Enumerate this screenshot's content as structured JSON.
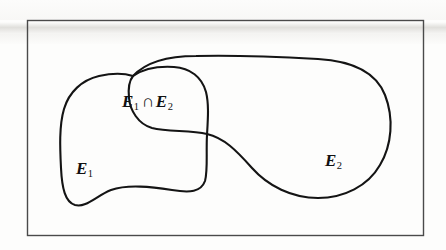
{
  "figure": {
    "kind": "venn-diagram",
    "frame": {
      "name": "universal-set-rectangle",
      "x": 27,
      "y": 20,
      "width": 397,
      "height": 216,
      "border_color": "#4a4a4a"
    },
    "stroke_color": "#141414",
    "background_color": "#fdfdfc"
  },
  "labels": {
    "intersection": {
      "set_a": "E",
      "set_a_sub": "1",
      "operator": "∩",
      "set_b": "E",
      "set_b_sub": "2",
      "text": "E1 ∩ E2"
    },
    "e1": {
      "symbol": "E",
      "subscript": "1",
      "text": "E1"
    },
    "e2": {
      "symbol": "E",
      "subscript": "2",
      "text": "E2"
    }
  },
  "regions": [
    {
      "name": "set-e1",
      "label": "E1",
      "position": "left",
      "bounds": {
        "left": 60,
        "top": 73,
        "right": 208,
        "bottom": 207
      }
    },
    {
      "name": "set-e2",
      "label": "E2",
      "position": "right",
      "bounds": {
        "left": 133,
        "top": 57,
        "right": 390,
        "bottom": 198
      }
    },
    {
      "name": "intersection-e1-e2",
      "label": "E1 ∩ E2",
      "position": "center-upper",
      "bounds": {
        "left": 133,
        "top": 66,
        "right": 208,
        "bottom": 140
      }
    }
  ]
}
